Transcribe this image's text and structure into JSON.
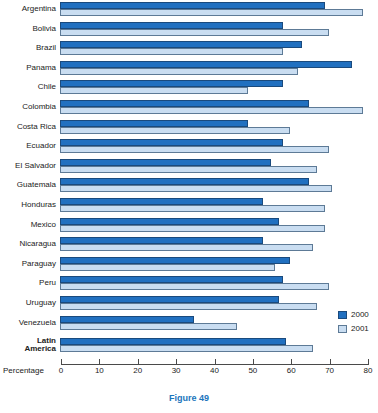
{
  "figure": {
    "caption": "Figure 49"
  },
  "axis": {
    "label": "Percentage",
    "ticks": [
      "0",
      "10",
      "20",
      "30",
      "40",
      "50",
      "60",
      "70",
      "80"
    ]
  },
  "legend": {
    "items": [
      {
        "label": "2000",
        "color": "#2170C0"
      },
      {
        "label": "2001",
        "color": "#C9DDF1"
      }
    ]
  },
  "colors": {
    "series_2000": "#2170C0",
    "series_2001": "#C9DDF1",
    "caption": "#1B75BC"
  },
  "chart_data": {
    "type": "bar",
    "orientation": "horizontal",
    "title": "",
    "xlabel": "Percentage",
    "xlim": [
      0,
      80
    ],
    "grid": false,
    "legend_position": "bottom-right",
    "highlight_category": "Latin America",
    "categories": [
      "Argentina",
      "Bolivia",
      "Brazil",
      "Panama",
      "Chile",
      "Colombia",
      "Costa Rica",
      "Ecuador",
      "El Salvador",
      "Guatemala",
      "Honduras",
      "Mexico",
      "Nicaragua",
      "Paraguay",
      "Peru",
      "Uruguay",
      "Venezuela",
      "Latin America"
    ],
    "series": [
      {
        "name": "2000",
        "values": [
          69,
          58,
          63,
          76,
          58,
          65,
          49,
          58,
          55,
          65,
          53,
          57,
          53,
          60,
          58,
          57,
          35,
          59
        ]
      },
      {
        "name": "2001",
        "values": [
          79,
          70,
          58,
          62,
          49,
          79,
          60,
          70,
          67,
          71,
          69,
          69,
          66,
          56,
          70,
          67,
          46,
          66
        ]
      }
    ]
  }
}
